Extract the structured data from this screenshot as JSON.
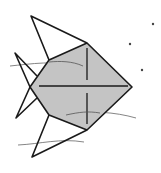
{
  "illustration": {
    "subject": "origami-style fish line drawing",
    "colors": {
      "background": "#ffffff",
      "body_fill": "#c4c4c4",
      "outline": "#1a1a1a",
      "water_line": "#555555",
      "bubble": "#444444"
    },
    "body_points": "49,60 87,43 132,87 87,130 49,115 30,87",
    "top_fin_points": "49,60 31,16 87,43",
    "bottom_fin_points": "49,115 32,157 87,130",
    "tail_upper": "36,75 15,53 30,87",
    "tail_lower": "36,98 16,118 30,87",
    "bubbles": [
      {
        "cx": 153,
        "cy": 24
      },
      {
        "cx": 130,
        "cy": 44
      },
      {
        "cx": 142,
        "cy": 70
      }
    ]
  }
}
